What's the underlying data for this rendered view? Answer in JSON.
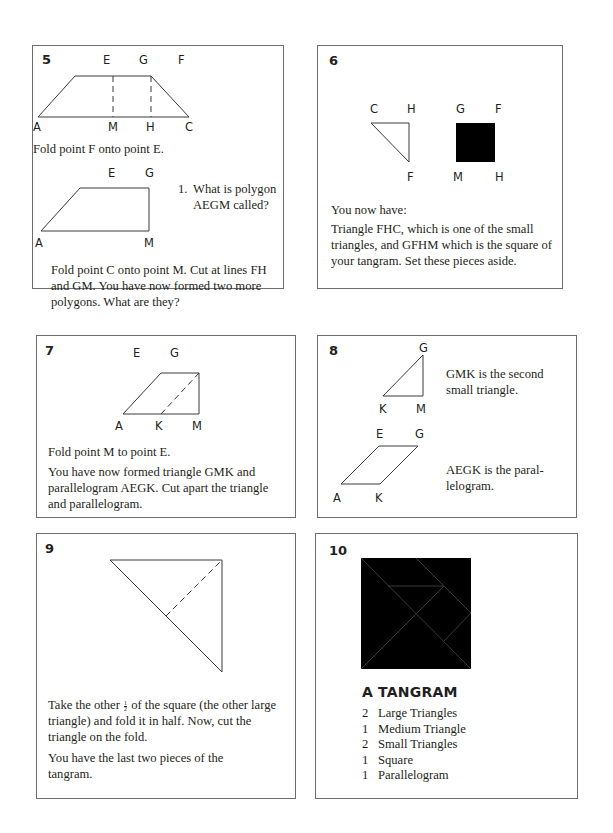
{
  "panels": {
    "p5": {
      "number": "5",
      "labels_top": {
        "E": "E",
        "G": "G",
        "F": "F"
      },
      "labels_bottom": {
        "A": "A",
        "M": "M",
        "H": "H",
        "C": "C"
      },
      "instruction_1": "Fold point F onto point E.",
      "sub_labels": {
        "E": "E",
        "G": "G",
        "A": "A",
        "M": "M"
      },
      "question_num": "1.",
      "question_line1": "What is polygon",
      "question_line2": "AEGM called?",
      "instruction_2": "Fold point C onto point M. Cut at lines FH and GM. You have now formed two more polygons. What are they?"
    },
    "p6": {
      "number": "6",
      "triangle_labels": {
        "C": "C",
        "H": "H",
        "F": "F"
      },
      "square_labels": {
        "G": "G",
        "F": "F",
        "M": "M",
        "H": "H"
      },
      "text_1": "You now have:",
      "text_2": "Triangle FHC, which is one of the small triangles, and GFHM which is the square of your tangram. Set these pieces aside."
    },
    "p7": {
      "number": "7",
      "labels": {
        "E": "E",
        "G": "G",
        "A": "A",
        "K": "K",
        "M": "M"
      },
      "text_1": "Fold point M to point E.",
      "text_2": "You have now formed triangle GMK and parallelogram AEGK. Cut apart the triangle and parallelogram."
    },
    "p8": {
      "number": "8",
      "triangle_labels": {
        "G": "G",
        "K": "K",
        "M": "M"
      },
      "triangle_text": "GMK is the second small triangle.",
      "para_labels": {
        "E": "E",
        "G": "G",
        "A": "A",
        "K": "K"
      },
      "para_text_1": "AEGK is the paral-",
      "para_text_2": "lelogram."
    },
    "p9": {
      "number": "9",
      "text_1_pre": "Take the other",
      "fraction_num": "1",
      "fraction_den": "2",
      "text_1_post": "of the square (the other large triangle) and fold it in half. Now, cut the triangle on the fold.",
      "text_2": "You have the last two pieces of the tangram."
    },
    "p10": {
      "number": "10",
      "title": "A TANGRAM",
      "pieces": [
        {
          "qty": "2",
          "name": "Large Triangles"
        },
        {
          "qty": "1",
          "name": "Medium Triangle"
        },
        {
          "qty": "2",
          "name": "Small Triangles"
        },
        {
          "qty": "1",
          "name": "Square"
        },
        {
          "qty": "1",
          "name": "Parallelogram"
        }
      ]
    }
  },
  "colors": {
    "ink": "#231f20",
    "border": "#6d6d6d",
    "background": "#ffffff"
  }
}
